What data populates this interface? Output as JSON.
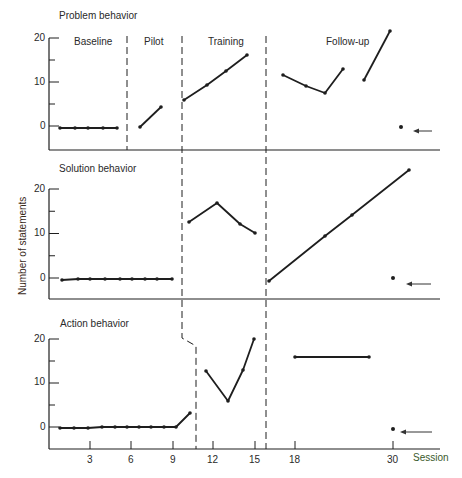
{
  "chart_data": {
    "type": "line",
    "ylabel": "Number of statements",
    "xlabel": "Session",
    "x_ticks": [
      3,
      6,
      9,
      12,
      15,
      18,
      30
    ],
    "y_ticks": [
      0,
      10,
      20
    ],
    "phases": [
      "Baseline",
      "Pilot",
      "Training",
      "Follow-up"
    ],
    "panels": [
      {
        "title": "Problem behavior",
        "segments": [
          {
            "phase": "Baseline",
            "points": [
              [
                1,
                -0.5
              ],
              [
                2,
                -0.5
              ],
              [
                3,
                -0.5
              ],
              [
                4,
                -0.4
              ],
              [
                5,
                -0.4
              ]
            ]
          },
          {
            "phase": "Pilot",
            "points": [
              [
                7,
                -0.2
              ],
              [
                8,
                4.3
              ]
            ]
          },
          {
            "phase": "Training",
            "points": [
              [
                10,
                5.9
              ],
              [
                11,
                9.3
              ],
              [
                12,
                12.5
              ],
              [
                13,
                16.1
              ]
            ]
          },
          {
            "phase": "Follow-up",
            "points": [
              [
                17,
                11.6
              ],
              [
                18,
                9.1
              ],
              [
                19,
                7.5
              ],
              [
                20,
                12.9
              ]
            ]
          },
          {
            "phase": "Follow-up",
            "points": [
              [
                21,
                10.5
              ],
              [
                22,
                21.6
              ]
            ]
          }
        ],
        "marker": {
          "session": 30,
          "value": 0,
          "arrow": true
        }
      },
      {
        "title": "Solution behavior",
        "segments": [
          {
            "phase": "Baseline",
            "points": [
              [
                1,
                -0.6
              ],
              [
                2,
                -0.5
              ],
              [
                3,
                -0.5
              ],
              [
                4,
                -0.5
              ],
              [
                5,
                -0.5
              ],
              [
                6,
                -0.4
              ],
              [
                7,
                -0.4
              ],
              [
                8,
                -0.4
              ],
              [
                9,
                -0.4
              ]
            ]
          },
          {
            "phase": "Training",
            "points": [
              [
                10,
                12.7
              ],
              [
                12,
                17.0
              ],
              [
                14,
                12.3
              ],
              [
                15,
                10.2
              ]
            ]
          },
          {
            "phase": "Follow-up",
            "points": [
              [
                16,
                -0.7
              ],
              [
                20,
                9.5
              ],
              [
                22,
                14.3
              ],
              [
                26,
                24.5
              ]
            ]
          }
        ],
        "marker": {
          "session": 30,
          "value": 0,
          "arrow": true
        }
      },
      {
        "title": "Action behavior",
        "segments": [
          {
            "phase": "Baseline",
            "points": [
              [
                1,
                -0.3
              ],
              [
                2,
                -0.3
              ],
              [
                3,
                -0.2
              ],
              [
                4,
                -0.2
              ],
              [
                5,
                -0.1
              ],
              [
                6,
                0
              ],
              [
                7,
                0
              ],
              [
                8,
                0.1
              ],
              [
                9,
                0.1
              ],
              [
                9.3,
                0.2
              ],
              [
                10,
                3.2
              ]
            ]
          },
          {
            "phase": "Training",
            "points": [
              [
                11.5,
                12.7
              ],
              [
                13,
                5.9
              ],
              [
                14,
                13.0
              ],
              [
                15,
                20.0
              ]
            ]
          },
          {
            "phase": "Follow-up",
            "points": [
              [
                18,
                15.9
              ],
              [
                24,
                15.9
              ]
            ]
          }
        ],
        "marker": {
          "session": 30,
          "value": -0.5,
          "arrow": true
        }
      }
    ]
  },
  "labels": {
    "panel_titles": [
      "Problem behavior",
      "Solution behavior",
      "Action behavior"
    ],
    "phases": [
      "Baseline",
      "Pilot",
      "Training",
      "Follow-up"
    ],
    "ylabel": "Number of statements",
    "xlabel": "Session",
    "yticks": [
      "20",
      "10",
      "0"
    ],
    "xticks": [
      "3",
      "6",
      "9",
      "12",
      "15",
      "18",
      "30"
    ]
  },
  "render": {
    "panels": [
      {
        "top": 38,
        "zero": 126,
        "bottom": 150,
        "lines": [
          [
            [
              60,
              128
            ],
            [
              75,
              128
            ],
            [
              88,
              128
            ],
            [
              103,
              128
            ],
            [
              117,
              128
            ]
          ],
          [
            [
              140,
              127
            ],
            [
              161,
              107
            ]
          ],
          [
            [
              184,
              100
            ],
            [
              207,
              85
            ],
            [
              226,
              71
            ],
            [
              247,
              55
            ]
          ],
          [
            [
              283,
              75
            ],
            [
              306,
              86
            ],
            [
              325,
              93
            ],
            [
              343,
              69
            ]
          ],
          [
            [
              364,
              80
            ],
            [
              390,
              31
            ]
          ]
        ],
        "dot": [
          401,
          127
        ],
        "arrow": [
          413,
          432,
          131
        ]
      },
      {
        "top": 189,
        "zero": 278,
        "bottom": 299,
        "lines": [
          [
            [
              62,
              280
            ],
            [
              78,
              279
            ],
            [
              90,
              279
            ],
            [
              105,
              279
            ],
            [
              120,
              279
            ],
            [
              132,
              279
            ],
            [
              145,
              279
            ],
            [
              157,
              279
            ],
            [
              172,
              279
            ]
          ],
          [
            [
              189,
              222
            ],
            [
              217,
              203
            ],
            [
              240,
              224
            ],
            [
              255,
              233
            ]
          ],
          [
            [
              269,
              281
            ],
            [
              325,
              236
            ],
            [
              352,
              215
            ],
            [
              409,
              170
            ]
          ]
        ],
        "dot": [
          393,
          278
        ],
        "arrow": [
          406,
          431,
          284
        ]
      },
      {
        "top": 339,
        "zero": 427,
        "bottom": 449,
        "lines": [
          [
            [
              60,
              428
            ],
            [
              74,
              428
            ],
            [
              88,
              428
            ],
            [
              102,
              427
            ],
            [
              115,
              427
            ],
            [
              127,
              427
            ],
            [
              139,
              427
            ],
            [
              151,
              427
            ],
            [
              164,
              427
            ],
            [
              176,
              427
            ],
            [
              190,
              413
            ]
          ],
          [
            [
              206,
              371
            ],
            [
              228,
              401
            ],
            [
              243,
              370
            ],
            [
              254,
              339
            ]
          ],
          [
            [
              295,
              357
            ],
            [
              369,
              357
            ]
          ]
        ],
        "dot": [
          393,
          429
        ],
        "arrow": [
          400,
          432,
          432
        ]
      }
    ],
    "xticks_px": [
      90,
      131,
      173,
      213,
      255,
      295,
      393
    ]
  }
}
